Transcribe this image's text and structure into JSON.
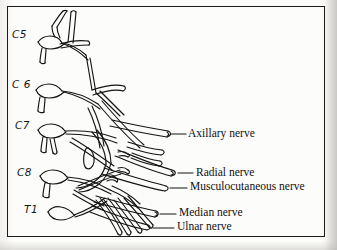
{
  "figure": {
    "frame_color": "#1a1a1a",
    "ink_color": "#111111",
    "paper_color": "#fbfaf8"
  },
  "root_labels": [
    {
      "text": "C5",
      "x": 12,
      "y": 35
    },
    {
      "text": "C 6",
      "x": 12,
      "y": 84
    },
    {
      "text": "C7",
      "x": 15,
      "y": 125
    },
    {
      "text": "C8",
      "x": 17,
      "y": 172
    },
    {
      "text": "T1",
      "x": 24,
      "y": 209
    }
  ],
  "nerve_labels": [
    {
      "text": "Axillary nerve",
      "x": 188,
      "y": 129
    },
    {
      "text": "Radial nerve",
      "x": 196,
      "y": 168
    },
    {
      "text": "Musculocutaneous nerve",
      "x": 190,
      "y": 182
    },
    {
      "text": "Median nerve",
      "x": 179,
      "y": 208
    },
    {
      "text": "Ulnar nerve",
      "x": 177,
      "y": 222
    }
  ],
  "leader_lines": [
    {
      "name": "axillary-leader",
      "x1": 170,
      "y1": 134,
      "x2": 186,
      "y2": 134
    },
    {
      "name": "radial-leader",
      "x1": 178,
      "y1": 173,
      "x2": 194,
      "y2": 173
    },
    {
      "name": "musculocutaneous-leader",
      "x1": 172,
      "y1": 187,
      "x2": 188,
      "y2": 187
    },
    {
      "name": "median-leader",
      "x1": 160,
      "y1": 213,
      "x2": 177,
      "y2": 213
    },
    {
      "name": "ulnar-leader",
      "x1": 155,
      "y1": 227,
      "x2": 175,
      "y2": 227
    }
  ]
}
